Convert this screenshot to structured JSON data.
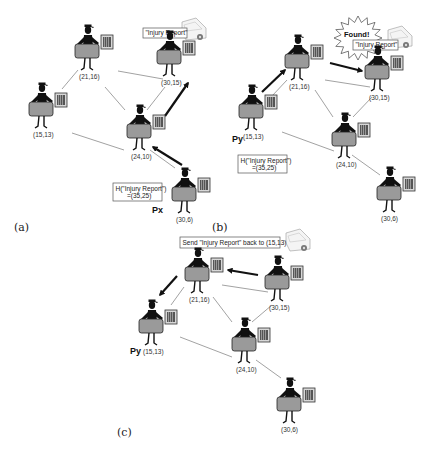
{
  "figure": {
    "panels": [
      {
        "id": "a",
        "label": "(a)",
        "label_pos": [
          14,
          231
        ],
        "nodes": [
          {
            "id": "n21_16",
            "coord": "(21,16)",
            "x": 88,
            "y": 52
          },
          {
            "id": "n30_15",
            "coord": "(30,15)",
            "x": 170,
            "y": 58
          },
          {
            "id": "n15_13",
            "coord": "(15,13)",
            "x": 42,
            "y": 110
          },
          {
            "id": "n24_10",
            "coord": "(24,10)",
            "x": 140,
            "y": 132
          },
          {
            "id": "n30_6",
            "coord": "(30,6)",
            "x": 185,
            "y": 195
          }
        ],
        "edges": [
          [
            118,
            71,
            163,
            79
          ],
          [
            62,
            89,
            78,
            70
          ],
          [
            105,
            87,
            125,
            110
          ],
          [
            165,
            87,
            147,
            110
          ],
          [
            72,
            133,
            124,
            150
          ],
          [
            150,
            150,
            175,
            168
          ]
        ],
        "arrows": [
          [
            182,
            165,
            153,
            147
          ],
          [
            165,
            116,
            188,
            83
          ]
        ],
        "boxes": [
          {
            "text": "\"Injury Report\"",
            "x": 143,
            "y": 28,
            "w": 44,
            "h": 10
          }
        ],
        "hash_box": {
          "line1": "H(\"Injury Report\")",
          "line2": "=(35,25)",
          "x": 113,
          "y": 183,
          "w": 49,
          "h": 18
        },
        "truck": {
          "x": 182,
          "y": 22
        },
        "agent_label": {
          "text": "Px",
          "x": 152,
          "y": 213
        }
      },
      {
        "id": "b",
        "label": "(b)",
        "label_pos": [
          212,
          231
        ],
        "nodes": [
          {
            "id": "n21_16",
            "coord": "(21,16)",
            "x": 298,
            "y": 62
          },
          {
            "id": "n30_15",
            "coord": "(30,15)",
            "x": 378,
            "y": 73
          },
          {
            "id": "n15_13",
            "coord": "(15,13)",
            "x": 252,
            "y": 112
          },
          {
            "id": "n24_10",
            "coord": "(24,10)",
            "x": 345,
            "y": 140
          },
          {
            "id": "n30_6",
            "coord": "(30,6)",
            "x": 390,
            "y": 194
          }
        ],
        "edges": [
          [
            325,
            80,
            370,
            87
          ],
          [
            272,
            96,
            287,
            80
          ],
          [
            315,
            90,
            333,
            117
          ],
          [
            372,
            97,
            353,
            117
          ],
          [
            282,
            132,
            334,
            151
          ],
          [
            352,
            155,
            380,
            175
          ]
        ],
        "arrows": [
          [
            262,
            92,
            285,
            70
          ],
          [
            330,
            63,
            362,
            71
          ]
        ],
        "boxes": [
          {
            "text": "\"Injury Report\"",
            "x": 353,
            "y": 40,
            "w": 45,
            "h": 10
          }
        ],
        "starburst": {
          "text": "Found!",
          "cx": 358,
          "cy": 38
        },
        "hash_box": {
          "line1": "H(\"Injury Report\")",
          "line2": "=(35,25)",
          "x": 238,
          "y": 155,
          "w": 49,
          "h": 18
        },
        "truck": {
          "x": 388,
          "y": 30
        },
        "agent_label": {
          "text": "Py",
          "x": 232,
          "y": 142
        }
      },
      {
        "id": "c",
        "label": "(c)",
        "label_pos": [
          117,
          436
        ],
        "nodes": [
          {
            "id": "n21_16",
            "coord": "(21,16)",
            "x": 198,
            "y": 275
          },
          {
            "id": "n30_15",
            "coord": "(30,15)",
            "x": 278,
            "y": 283
          },
          {
            "id": "n15_13",
            "coord": "(15,13)",
            "x": 152,
            "y": 327
          },
          {
            "id": "n24_10",
            "coord": "(24,10)",
            "x": 245,
            "y": 345
          },
          {
            "id": "n30_6",
            "coord": "(30,6)",
            "x": 290,
            "y": 405
          }
        ],
        "edges": [
          [
            222,
            285,
            268,
            292
          ],
          [
            171,
            305,
            184,
            287
          ],
          [
            213,
            297,
            232,
            322
          ],
          [
            272,
            305,
            252,
            322
          ],
          [
            180,
            337,
            232,
            357
          ],
          [
            256,
            360,
            281,
            378
          ]
        ],
        "arrows": [
          [
            258,
            275,
            228,
            270
          ],
          [
            177,
            276,
            160,
            295
          ]
        ],
        "boxes": [
          {
            "text": "Send \"Injury Report\" back to (15,13)",
            "x": 180,
            "y": 237,
            "w": 100,
            "h": 11
          }
        ],
        "truck": {
          "x": 286,
          "y": 233
        },
        "agent_label": {
          "text": "Py",
          "x": 130,
          "y": 354
        }
      }
    ]
  },
  "colors": {
    "edge": "#8a8a8a",
    "arrow": "#111111",
    "body": "#111111",
    "bag": "#9a9a9a",
    "box_border": "#555555"
  }
}
